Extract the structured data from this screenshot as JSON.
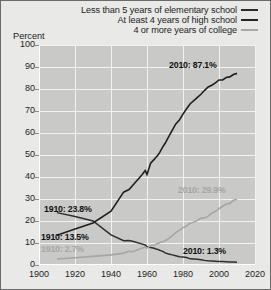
{
  "axis_title": "Percent",
  "legend": [
    {
      "label": "Less than 5 years of elementary school",
      "swatch": "elementary-line-swatch",
      "color": "#2b2b2b"
    },
    {
      "label": "At least 4 years of high school",
      "swatch": "highschool-line-swatch",
      "color": "#242424"
    },
    {
      "label": "4 or more years of college",
      "swatch": "college-line-swatch",
      "color": "#a8a8a8"
    }
  ],
  "annotations": [
    {
      "text": "2010: 87.1%",
      "tone": "dark",
      "left": 168,
      "top": 59
    },
    {
      "text": "2010: 29.9%",
      "tone": "light",
      "left": 177,
      "top": 184
    },
    {
      "text": "2010: 1.3%",
      "tone": "dark",
      "left": 182,
      "top": 245
    },
    {
      "text": "1910: 23.8%",
      "tone": "dark",
      "left": 43,
      "top": 203
    },
    {
      "text": "1910: 13.5%",
      "tone": "dark",
      "left": 40,
      "top": 231
    },
    {
      "text": "1910: 2.7%",
      "tone": "light",
      "left": 40,
      "top": 243
    }
  ],
  "chart_data": {
    "type": "line",
    "title": "",
    "xlabel": "",
    "ylabel": "Percent",
    "xlim": [
      1900,
      2020
    ],
    "ylim": [
      0,
      100
    ],
    "xticks": [
      1900,
      1920,
      1940,
      1960,
      1980,
      2000,
      2020
    ],
    "yticks": [
      0,
      10,
      20,
      30,
      40,
      50,
      60,
      70,
      80,
      90,
      100
    ],
    "grid": true,
    "legend_position": "top-right",
    "series": [
      {
        "name": "Less than 5 years of elementary school",
        "color": "#2e2e2e",
        "x": [
          1910,
          1920,
          1930,
          1940,
          1947,
          1950,
          1952,
          1957,
          1959,
          1960,
          1962,
          1964,
          1965,
          1966,
          1967,
          1968,
          1969,
          1970,
          1972,
          1974,
          1976,
          1978,
          1980,
          1982,
          1984,
          1986,
          1988,
          1990,
          1992,
          1994,
          1996,
          1998,
          2000,
          2002,
          2004,
          2006,
          2008,
          2010
        ],
        "values": [
          23.8,
          22.0,
          20.0,
          13.7,
          11.0,
          11.1,
          10.8,
          9.6,
          9.1,
          8.3,
          8.0,
          7.6,
          7.3,
          7.1,
          6.7,
          6.4,
          6.1,
          5.5,
          5.0,
          4.6,
          4.2,
          3.8,
          3.6,
          3.4,
          2.8,
          2.7,
          2.6,
          2.4,
          2.1,
          1.9,
          1.8,
          1.7,
          1.6,
          1.6,
          1.5,
          1.4,
          1.4,
          1.3
        ]
      },
      {
        "name": "At least 4 years of high school",
        "color": "#1f1f1f",
        "x": [
          1910,
          1920,
          1930,
          1940,
          1947,
          1950,
          1952,
          1957,
          1959,
          1960,
          1962,
          1964,
          1965,
          1966,
          1967,
          1968,
          1969,
          1970,
          1972,
          1974,
          1976,
          1978,
          1980,
          1982,
          1984,
          1986,
          1988,
          1990,
          1992,
          1994,
          1996,
          1998,
          2000,
          2002,
          2004,
          2006,
          2008,
          2010
        ],
        "values": [
          13.5,
          16.4,
          19.1,
          24.5,
          33.1,
          34.3,
          36.1,
          40.8,
          42.9,
          41.1,
          46.3,
          48.0,
          49.0,
          49.9,
          51.1,
          52.6,
          54.0,
          55.2,
          58.2,
          61.2,
          64.1,
          65.9,
          68.6,
          71.0,
          73.3,
          74.7,
          76.2,
          77.6,
          79.4,
          80.9,
          81.7,
          82.8,
          84.1,
          84.1,
          85.2,
          85.5,
          86.6,
          87.1
        ]
      },
      {
        "name": "4 or more years of college",
        "color": "#a6a6a6",
        "x": [
          1910,
          1920,
          1930,
          1940,
          1947,
          1950,
          1952,
          1957,
          1959,
          1960,
          1962,
          1964,
          1965,
          1966,
          1967,
          1968,
          1969,
          1970,
          1972,
          1974,
          1976,
          1978,
          1980,
          1982,
          1984,
          1986,
          1988,
          1990,
          1992,
          1994,
          1996,
          1998,
          2000,
          2002,
          2004,
          2006,
          2008,
          2010
        ],
        "values": [
          2.7,
          3.3,
          3.9,
          4.6,
          5.4,
          6.2,
          6.0,
          7.6,
          8.1,
          7.7,
          8.8,
          9.1,
          9.4,
          9.8,
          10.1,
          10.5,
          10.7,
          11.0,
          12.0,
          13.3,
          14.7,
          15.7,
          17.0,
          17.7,
          19.1,
          19.4,
          20.3,
          21.3,
          21.4,
          22.2,
          23.6,
          24.4,
          25.6,
          26.7,
          27.7,
          28.0,
          29.4,
          29.9
        ]
      }
    ]
  }
}
